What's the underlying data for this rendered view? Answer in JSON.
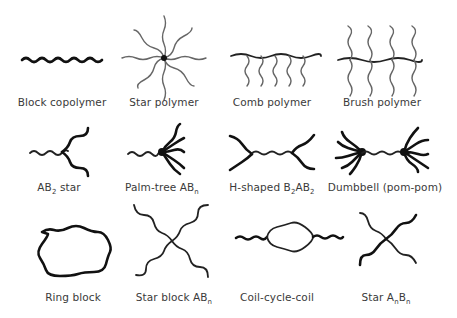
{
  "figure": {
    "rows": [
      {
        "items": [
          {
            "id": "block-copolymer",
            "label": "Block copolymer"
          },
          {
            "id": "star-polymer",
            "label": "Star polymer"
          },
          {
            "id": "comb-polymer",
            "label": "Comb polymer"
          },
          {
            "id": "brush-polymer",
            "label": "Brush polymer"
          }
        ]
      },
      {
        "items": [
          {
            "id": "ab2-star",
            "label": "AB",
            "sub": "2",
            "suffix": " star"
          },
          {
            "id": "palm-tree-abn",
            "label": "Palm-tree AB",
            "sub": "n",
            "suffix": ""
          },
          {
            "id": "h-shaped-b2ab2",
            "label": "H-shaped B",
            "sub": "2",
            "mid": "AB",
            "sub2": "2"
          },
          {
            "id": "dumbbell-pom-pom",
            "label": "Dumbbell (pom-pom)"
          }
        ]
      },
      {
        "items": [
          {
            "id": "ring-block",
            "label": "Ring block"
          },
          {
            "id": "star-block-abn",
            "label": "Star block AB",
            "sub": "n"
          },
          {
            "id": "coil-cycle-coil",
            "label": "Coil-cycle-coil"
          },
          {
            "id": "star-anbn",
            "label": "Star A",
            "sub": "n",
            "mid": "B",
            "sub2": "n"
          }
        ]
      }
    ]
  }
}
